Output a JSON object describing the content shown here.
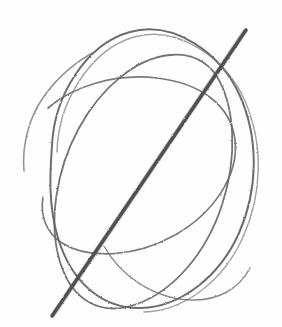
{
  "canvas": {
    "width": 282,
    "height": 327,
    "background_color": "#ffffff",
    "medium": "graphite pencil sketch",
    "subject": "sphere construction drawing with axis line"
  },
  "palette": {
    "paper": "#ffffff",
    "light_graphite": "#6e6e72",
    "mid_graphite": "#5a5a60",
    "dark_graphite": "#4a4a4e",
    "axis_graphite": "#3f3f45"
  },
  "strokes": [
    {
      "id": "outer-contour-main",
      "name": "outer-egg-contour",
      "color": "#5d5d63",
      "width": 2.0,
      "opacity": 0.92,
      "d": "M 52 146 C 54 96, 86 44, 130 32 C 174 20, 221 53, 240 96 C 259 139, 258 190, 239 233 C 220 276, 181 307, 141 308 C 101 309, 71 281, 58 238 C 48 205, 50 172, 52 146 Z"
    },
    {
      "id": "outer-contour-ghost",
      "name": "outer-contour-underdrawing",
      "color": "#76767c",
      "width": 1.5,
      "opacity": 0.7,
      "d": "M 57 152 C 58 104, 89 50, 134 37 C 178 25, 226 58, 245 101 C 264 145, 262 195, 243 237 C 224 280, 185 311, 144 312"
    },
    {
      "id": "left-tail-arc",
      "name": "left-sweeping-tail-stroke",
      "color": "#77777d",
      "width": 1.6,
      "opacity": 0.8,
      "d": "M 24 171 C 22 150, 27 124, 39 104 C 51 84, 70 66, 92 53"
    },
    {
      "id": "longitude-ellipse",
      "name": "longitude-ellipse-construction",
      "color": "#606066",
      "width": 1.8,
      "opacity": 0.9,
      "d": "M 216 75 C 235 105, 238 156, 222 205 C 206 254, 173 291, 137 304 C 101 317, 72 301, 60 262 C 48 223, 56 170, 79 128 C 102 86, 137 58, 170 55 C 190 53, 205 60, 216 75 Z"
    },
    {
      "id": "equator-ellipse",
      "name": "equator-ellipse-construction",
      "color": "#646468",
      "width": 1.7,
      "opacity": 0.88,
      "d": "M 48 108 C 72 87, 114 73, 157 78 C 200 83, 231 105, 235 140 C 239 175, 214 213, 175 235 C 136 257, 89 260, 62 243 C 46 233, 40 215, 43 197"
    },
    {
      "id": "inner-lower-arc",
      "name": "lower-cross-contour",
      "color": "#6a6a70",
      "width": 1.5,
      "opacity": 0.8,
      "d": "M 104 246 C 120 275, 152 298, 190 300 C 218 301, 239 289, 250 268"
    },
    {
      "id": "axis-line",
      "name": "major-axis-line",
      "color": "#3f3f45",
      "width": 3.4,
      "opacity": 0.96,
      "d": "M 52 316 L 246 30"
    },
    {
      "id": "axis-line-halo",
      "name": "major-axis-line-halo",
      "color": "#585860",
      "width": 5.2,
      "opacity": 0.3,
      "d": "M 53 315 L 245 31"
    }
  ],
  "labels": {
    "title": "",
    "caption": ""
  }
}
